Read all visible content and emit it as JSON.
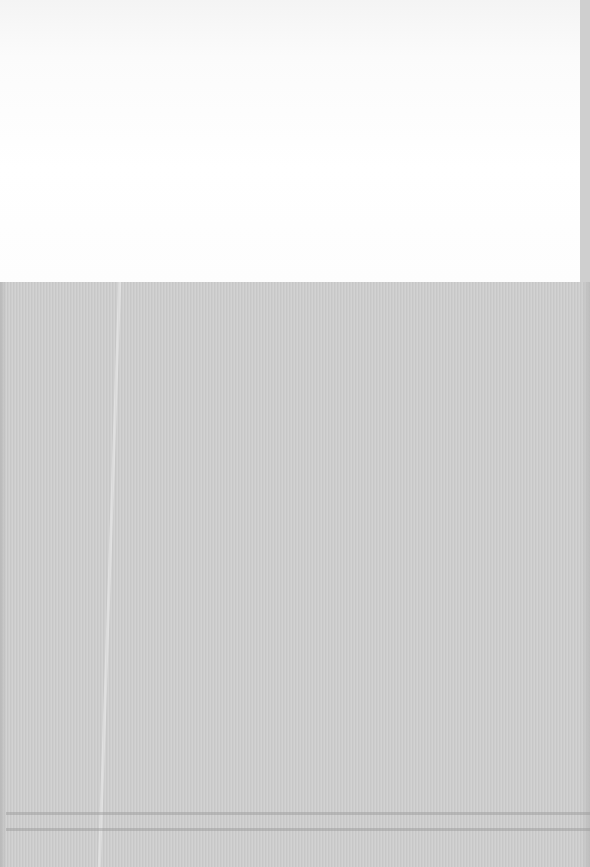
{
  "scene": {
    "description": "Faded blank paper sheet over grey textured fabric",
    "colors": {
      "paper": "#fdfdfd",
      "fabric": "#cdcdcd",
      "fold_line": "#969696"
    }
  }
}
